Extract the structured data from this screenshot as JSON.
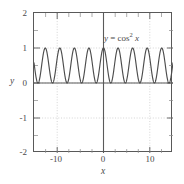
{
  "chart_data": {
    "type": "line",
    "title": "",
    "xlabel": "x",
    "ylabel": "y",
    "xlim": [
      -15,
      15
    ],
    "ylim": [
      -2,
      2
    ],
    "grid": true,
    "grid_style": "dotted",
    "legend": "none",
    "annotations": [
      {
        "text": "y = cos² x",
        "text_prefix": "y",
        "text_equals": "=",
        "text_func": "cos",
        "text_exponent": "2",
        "text_arg": "x",
        "x": 6.5,
        "y": 1.4
      }
    ],
    "xticks": [
      -10,
      0,
      10
    ],
    "xtick_labels": [
      "-10",
      "0",
      "10"
    ],
    "xticks_minor": [
      -15,
      -12.5,
      -7.5,
      -5,
      -2.5,
      2.5,
      5,
      7.5,
      12.5,
      15
    ],
    "yticks": [
      2,
      1,
      0,
      -1,
      -2
    ],
    "ytick_labels": [
      "2",
      "1",
      "0",
      "-1",
      "-2"
    ],
    "yticks_minor": [
      1.5,
      0.5,
      -0.5,
      -1.5
    ],
    "series": [
      {
        "name": "y = cos^2 x",
        "expression": "cos(x)^2",
        "color": "#4d4d4d",
        "linewidth": 1,
        "period": 3.14159,
        "amplitude": 0.5,
        "offset": 0.5,
        "ymin": 0,
        "ymax": 1,
        "n_peaks_visible": 10,
        "x_start": -15,
        "x_end": 15,
        "y_at_x_start": 0.54,
        "y_at_x_end": 0.54
      }
    ],
    "axis_lines": {
      "x_zero_line": true,
      "y_zero_line": true,
      "color": "#5a5a5a"
    }
  },
  "colors": {
    "background": "#ffffff",
    "frame": "#595959",
    "gridline": "#c8c8c8",
    "axis_line": "#5a5a5a",
    "curve": "#4d4d4d",
    "text": "#4a4a4a"
  }
}
